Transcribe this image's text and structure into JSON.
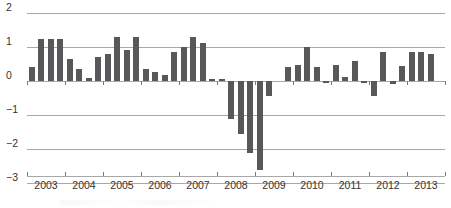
{
  "chart_data": {
    "type": "bar",
    "title": "",
    "xlabel": "",
    "ylabel": "",
    "ylim": [
      -3.2,
      2.2
    ],
    "grid": true,
    "legend": "none",
    "y_ticks": [
      2,
      1,
      0,
      -1,
      -2,
      -3
    ],
    "y_tick_labels": [
      "2",
      "1",
      "0",
      "−1",
      "−2",
      "−3"
    ],
    "x_tick_labels": [
      "2003",
      "2004",
      "2005",
      "2006",
      "2007",
      "2008",
      "2009",
      "2010",
      "2011",
      "2012",
      "2013"
    ],
    "categories": [
      "2003 Q1",
      "2003 Q2",
      "2003 Q3",
      "2003 Q4",
      "2004 Q1",
      "2004 Q2",
      "2004 Q3",
      "2004 Q4",
      "2005 Q1",
      "2005 Q2",
      "2005 Q3",
      "2005 Q4",
      "2006 Q1",
      "2006 Q2",
      "2006 Q3",
      "2006 Q4",
      "2007 Q1",
      "2007 Q2",
      "2007 Q3",
      "2007 Q4",
      "2008 Q1",
      "2008 Q2",
      "2008 Q3",
      "2008 Q4",
      "2009 Q1",
      "2009 Q2",
      "2009 Q3",
      "2009 Q4",
      "2010 Q1",
      "2010 Q2",
      "2010 Q3",
      "2010 Q4",
      "2011 Q1",
      "2011 Q2",
      "2011 Q3",
      "2011 Q4",
      "2012 Q1",
      "2012 Q2",
      "2012 Q3",
      "2012 Q4",
      "2013 Q1",
      "2013 Q2",
      "2013 Q3",
      "2013 Q4"
    ],
    "values": [
      0.4,
      1.25,
      1.25,
      1.25,
      0.65,
      0.35,
      0.08,
      0.7,
      0.8,
      1.28,
      0.92,
      1.28,
      0.35,
      0.27,
      0.18,
      0.85,
      1.0,
      1.28,
      1.12,
      0.06,
      0.07,
      -1.12,
      -1.55,
      -2.12,
      -2.62,
      -0.45,
      0.0,
      0.4,
      0.48,
      1.0,
      0.4,
      -0.06,
      0.48,
      0.12,
      0.6,
      -0.05,
      -0.45,
      0.85,
      -0.08,
      0.45,
      0.85,
      0.85,
      0.78,
      0.0
    ],
    "bar_color": "#58585a",
    "gridline_color": "#a8a8a8",
    "background_color": "#ffffff",
    "axis_text_color": "#333333"
  }
}
